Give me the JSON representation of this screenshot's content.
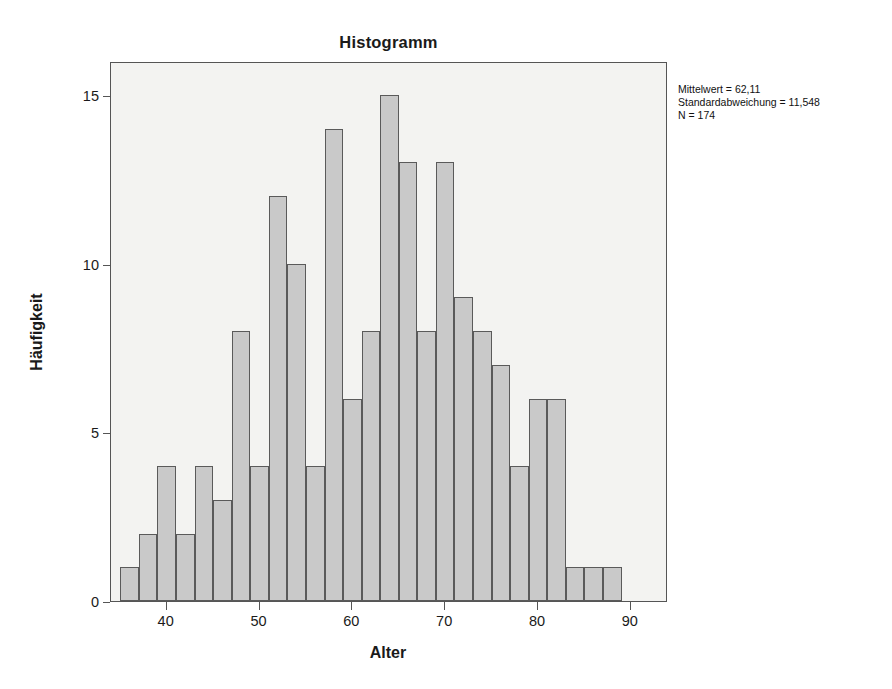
{
  "chart_data": {
    "type": "bar",
    "title": "Histogramm",
    "xlabel": "Alter",
    "ylabel": "Häufigkeit",
    "xlim": [
      34,
      94
    ],
    "ylim": [
      0,
      16
    ],
    "grid": false,
    "legend": null,
    "bin_width": 2,
    "bin_starts": [
      35,
      37,
      39,
      41,
      43,
      45,
      47,
      49,
      51,
      53,
      55,
      57,
      59,
      61,
      63,
      65,
      67,
      69,
      71,
      73,
      75,
      77,
      79,
      81,
      83,
      85,
      87
    ],
    "categories": [
      "35-37",
      "37-39",
      "39-41",
      "41-43",
      "43-45",
      "45-47",
      "47-49",
      "49-51",
      "51-53",
      "53-55",
      "55-57",
      "57-59",
      "59-61",
      "61-63",
      "63-65",
      "65-67",
      "67-69",
      "69-71",
      "71-73",
      "73-75",
      "75-77",
      "77-79",
      "79-81",
      "81-83",
      "83-85",
      "85-87",
      "87-89"
    ],
    "values": [
      1,
      2,
      4,
      2,
      4,
      3,
      8,
      4,
      12,
      10,
      4,
      14,
      6,
      8,
      15,
      13,
      8,
      13,
      9,
      8,
      7,
      4,
      6,
      6,
      1,
      1,
      1
    ],
    "xticks": [
      40,
      50,
      60,
      70,
      80,
      90
    ],
    "xtick_labels": [
      "40",
      "50",
      "60",
      "70",
      "80",
      "90"
    ],
    "yticks": [
      0,
      5,
      10,
      15
    ],
    "ytick_labels": [
      "0",
      "5",
      "10",
      "15"
    ],
    "annotations": [
      "Mittelwert = 62,11",
      "Standardabweichung = 11,548",
      "N = 174"
    ],
    "statistics": {
      "mean_label": "Mittelwert = 62,11",
      "mean": 62.11,
      "sd_label": "Standardabweichung = 11,548",
      "sd": 11.548,
      "n_label": "N = 174",
      "n": 174
    },
    "colors": {
      "bar_fill": "#c9c9c9",
      "bar_edge": "#5a5a5a",
      "plot_background": "#f3f3f1",
      "frame": "#555555",
      "text": "#1a1a1a",
      "page_background": "#ffffff"
    }
  }
}
